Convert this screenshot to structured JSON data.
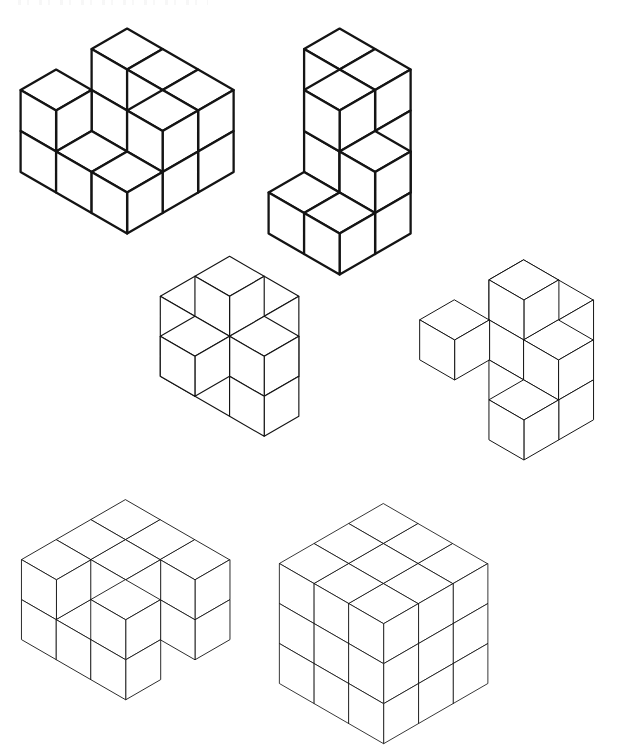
{
  "page": {
    "background_color": "#ffffff",
    "line_color": "#141414",
    "width": 635,
    "height": 739,
    "layout": "2 columns x 3 rows of isometric line drawings"
  },
  "figures": [
    {
      "id": "figure-top-left",
      "name": "Stacked cube assembly, heavy outline, upper left",
      "position": {
        "x": 14,
        "y": 22
      },
      "cube_size": 41,
      "stroke_width": 2.3,
      "style": "heavy",
      "projection": "isometric",
      "voxel_note": "Cubes given as [x, y, z] grid coordinates; x runs right-down, y runs left-down, z runs up.",
      "voxels": [
        [
          0,
          0,
          0
        ],
        [
          0,
          0,
          1
        ],
        [
          1,
          0,
          0
        ],
        [
          1,
          0,
          1
        ],
        [
          2,
          0,
          0
        ],
        [
          2,
          0,
          1
        ],
        [
          2,
          1,
          0
        ],
        [
          2,
          1,
          1
        ],
        [
          2,
          2,
          0
        ],
        [
          1,
          2,
          0
        ],
        [
          0,
          2,
          1
        ],
        [
          0,
          2,
          0
        ]
      ]
    },
    {
      "id": "figure-top-right",
      "name": "Stacked cube assembly, heavy outline, upper right",
      "position": {
        "x": 262,
        "y": 22
      },
      "cube_size": 41,
      "stroke_width": 2.3,
      "style": "heavy",
      "projection": "isometric",
      "voxels": [
        [
          0,
          0,
          0
        ],
        [
          0,
          0,
          1
        ],
        [
          0,
          0,
          2
        ],
        [
          1,
          0,
          0
        ],
        [
          1,
          0,
          1
        ],
        [
          1,
          0,
          2
        ],
        [
          1,
          1,
          2
        ],
        [
          2,
          1,
          0
        ],
        [
          2,
          1,
          1
        ],
        [
          2,
          2,
          0
        ],
        [
          1,
          2,
          0
        ]
      ]
    },
    {
      "id": "figure-middle-left",
      "name": "Interlocking block piece with raised cube, middle left",
      "position": {
        "x": 156,
        "y": 252
      },
      "cube_size": 40,
      "stroke_width": 1.15,
      "style": "medium",
      "projection": "isometric",
      "voxels": [
        [
          1,
          1,
          2
        ],
        [
          0,
          1,
          1
        ],
        [
          1,
          1,
          1
        ],
        [
          2,
          1,
          1
        ],
        [
          1,
          0,
          1
        ],
        [
          1,
          2,
          1
        ],
        [
          0,
          1,
          0
        ],
        [
          1,
          1,
          0
        ],
        [
          2,
          1,
          0
        ],
        [
          1,
          0,
          0
        ]
      ]
    },
    {
      "id": "figure-middle-right",
      "name": "Interlocking block piece with raised cube, middle right",
      "position": {
        "x": 416,
        "y": 256
      },
      "cube_size": 40,
      "stroke_width": 1.0,
      "style": "medium",
      "projection": "isometric",
      "voxels": [
        [
          1,
          1,
          2
        ],
        [
          0,
          0,
          1
        ],
        [
          1,
          1,
          1
        ],
        [
          2,
          1,
          1
        ],
        [
          0,
          2,
          1
        ],
        [
          1,
          0,
          1
        ],
        [
          0,
          0,
          0
        ],
        [
          1,
          1,
          0
        ],
        [
          2,
          1,
          0
        ],
        [
          2,
          2,
          0
        ]
      ]
    },
    {
      "id": "figure-bottom-left",
      "name": "Notched cross-shaped solid, bottom left",
      "position": {
        "x": 18,
        "y": 496
      },
      "cube_size": 40,
      "stroke_width": 0.9,
      "style": "light",
      "projection": "isometric",
      "voxels": [
        [
          0,
          0,
          1
        ],
        [
          1,
          0,
          1
        ],
        [
          2,
          0,
          1
        ],
        [
          0,
          1,
          1
        ],
        [
          0,
          2,
          1
        ],
        [
          1,
          1,
          1
        ],
        [
          2,
          2,
          1
        ],
        [
          0,
          0,
          0
        ],
        [
          1,
          0,
          0
        ],
        [
          2,
          0,
          0
        ],
        [
          0,
          1,
          0
        ],
        [
          0,
          2,
          0
        ],
        [
          2,
          2,
          0
        ],
        [
          1,
          2,
          0
        ]
      ]
    },
    {
      "id": "figure-bottom-right",
      "name": "Fully assembled interlocking burr cube, bottom right",
      "position": {
        "x": 276,
        "y": 500
      },
      "cube_size": 40,
      "stroke_width": 0.85,
      "style": "light",
      "projection": "isometric",
      "voxels": [
        [
          0,
          0,
          0
        ],
        [
          1,
          0,
          0
        ],
        [
          2,
          0,
          0
        ],
        [
          0,
          1,
          0
        ],
        [
          1,
          1,
          0
        ],
        [
          2,
          1,
          0
        ],
        [
          0,
          2,
          0
        ],
        [
          1,
          2,
          0
        ],
        [
          2,
          2,
          0
        ],
        [
          0,
          0,
          1
        ],
        [
          1,
          0,
          1
        ],
        [
          2,
          0,
          1
        ],
        [
          0,
          1,
          1
        ],
        [
          1,
          1,
          1
        ],
        [
          2,
          1,
          1
        ],
        [
          0,
          2,
          1
        ],
        [
          1,
          2,
          1
        ],
        [
          2,
          2,
          1
        ],
        [
          0,
          0,
          2
        ],
        [
          1,
          0,
          2
        ],
        [
          2,
          0,
          2
        ],
        [
          0,
          1,
          2
        ],
        [
          1,
          1,
          2
        ],
        [
          2,
          1,
          2
        ],
        [
          0,
          2,
          2
        ],
        [
          1,
          2,
          2
        ],
        [
          2,
          2,
          2
        ]
      ],
      "carved_note": "Cube with notches cut on visible faces forming burr-puzzle grooves",
      "notches": [
        [
          1,
          0,
          2
        ],
        [
          1,
          0,
          0
        ],
        [
          0,
          1,
          2
        ],
        [
          2,
          1,
          2
        ],
        [
          1,
          1,
          1
        ],
        [
          0,
          2,
          1
        ],
        [
          2,
          2,
          1
        ],
        [
          1,
          2,
          0
        ]
      ]
    }
  ]
}
